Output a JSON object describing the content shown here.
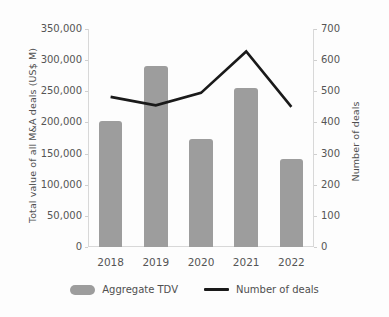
{
  "chart_data": {
    "type": "bar",
    "title": "",
    "subtitle": "",
    "categories": [
      "2018",
      "2019",
      "2020",
      "2021",
      "2022"
    ],
    "xlabel": "",
    "ylabel": "Total value of all M&A deals (US$ M)",
    "y2label": "Number of deals",
    "ylim": [
      0,
      350000
    ],
    "y2lim": [
      0,
      700
    ],
    "grid": false,
    "legend_position": "bottom",
    "y_ticks": [
      "0",
      "50,000",
      "100,000",
      "150,000",
      "200,000",
      "250,000",
      "300,000",
      "350,000"
    ],
    "y_tick_values": [
      0,
      50000,
      100000,
      150000,
      200000,
      250000,
      300000,
      350000
    ],
    "y2_ticks": [
      "0",
      "100",
      "200",
      "300",
      "400",
      "500",
      "600",
      "700"
    ],
    "y2_tick_values": [
      0,
      100,
      200,
      300,
      400,
      500,
      600,
      700
    ],
    "series": [
      {
        "name": "Aggregate TDV",
        "type": "bar",
        "axis": "left",
        "color": "#9d9d9d",
        "values": [
          202000,
          290000,
          174000,
          255000,
          141000
        ]
      },
      {
        "name": "Number of deals",
        "type": "line",
        "axis": "right",
        "color": "#1a1a1a",
        "values": [
          482,
          455,
          495,
          628,
          450
        ]
      }
    ]
  },
  "legend": {
    "items": [
      {
        "label": "Aggregate TDV",
        "marker": "bar-swatch"
      },
      {
        "label": "Number of deals",
        "marker": "line-swatch"
      }
    ]
  }
}
